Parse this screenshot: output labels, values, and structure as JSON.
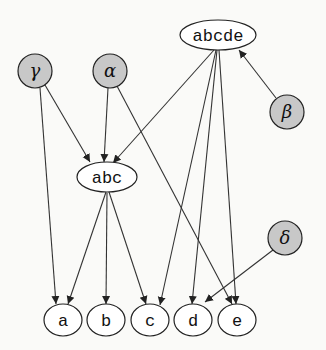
{
  "diagram": {
    "type": "directed-graph",
    "nodes": [
      {
        "id": "abcde",
        "label": "abcde",
        "shape": "ellipse",
        "shaded": false
      },
      {
        "id": "gamma",
        "label": "γ",
        "shape": "circle",
        "shaded": true
      },
      {
        "id": "alpha",
        "label": "α",
        "shape": "circle",
        "shaded": true
      },
      {
        "id": "beta",
        "label": "β",
        "shape": "circle",
        "shaded": true
      },
      {
        "id": "abc",
        "label": "abc",
        "shape": "ellipse",
        "shaded": false
      },
      {
        "id": "delta",
        "label": "δ",
        "shape": "circle",
        "shaded": true
      },
      {
        "id": "a",
        "label": "a",
        "shape": "ellipse",
        "shaded": false
      },
      {
        "id": "b",
        "label": "b",
        "shape": "ellipse",
        "shaded": false
      },
      {
        "id": "c",
        "label": "c",
        "shape": "ellipse",
        "shaded": false
      },
      {
        "id": "d",
        "label": "d",
        "shape": "ellipse",
        "shaded": false
      },
      {
        "id": "e",
        "label": "e",
        "shape": "ellipse",
        "shaded": false
      }
    ],
    "edges": [
      {
        "from": "gamma",
        "to": "abc"
      },
      {
        "from": "gamma",
        "to": "a"
      },
      {
        "from": "alpha",
        "to": "abc"
      },
      {
        "from": "alpha",
        "to": "e"
      },
      {
        "from": "abcde",
        "to": "abc"
      },
      {
        "from": "abcde",
        "to": "c"
      },
      {
        "from": "abcde",
        "to": "d"
      },
      {
        "from": "abcde",
        "to": "e"
      },
      {
        "from": "beta",
        "to": "abcde"
      },
      {
        "from": "abc",
        "to": "a"
      },
      {
        "from": "abc",
        "to": "b"
      },
      {
        "from": "abc",
        "to": "c"
      },
      {
        "from": "delta",
        "to": "d"
      }
    ],
    "colors": {
      "shaded_fill": "#c8c8c8",
      "plain_fill": "#ffffff",
      "stroke": "#222222",
      "background": "#fafaf8"
    }
  }
}
